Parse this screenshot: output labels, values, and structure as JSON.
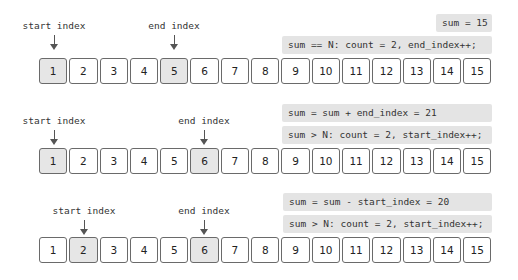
{
  "diagram": {
    "cells": [
      "1",
      "2",
      "3",
      "4",
      "5",
      "6",
      "7",
      "8",
      "9",
      "10",
      "11",
      "12",
      "13",
      "14",
      "15"
    ],
    "pointer_labels": {
      "start": "start index",
      "end": "end index"
    },
    "steps": [
      {
        "start_cell": 1,
        "end_cell": 5,
        "highlighted": [
          1,
          5
        ],
        "notes": [
          "sum = 15",
          "sum == N: count = 2, end_index++;"
        ]
      },
      {
        "start_cell": 1,
        "end_cell": 6,
        "highlighted": [
          1,
          6
        ],
        "notes": [
          "sum = sum + end_index = 21",
          "sum > N: count = 2, start_index++;"
        ]
      },
      {
        "start_cell": 2,
        "end_cell": 6,
        "highlighted": [
          2,
          6
        ],
        "notes": [
          "sum = sum - start_index = 20",
          "sum > N: count = 2, start_index++;"
        ]
      }
    ]
  },
  "colors": {
    "highlight_cell": "#e6e6e6",
    "note_background": "#e4e4e4",
    "border": "#6a6a6a"
  }
}
